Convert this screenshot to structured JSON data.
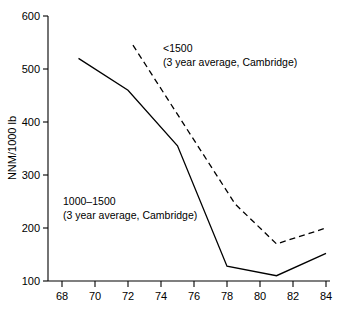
{
  "chart_data": {
    "type": "line",
    "title": "",
    "subtitle": "",
    "xlabel": "",
    "ylabel": "NNM/1000 lb",
    "xlim": [
      67.2,
      84.6
    ],
    "ylim": [
      100,
      600
    ],
    "xticks": [
      68,
      70,
      72,
      74,
      76,
      78,
      80,
      82,
      84
    ],
    "xtick_labels": [
      "68",
      "70",
      "72",
      "74",
      "76",
      "78",
      "80",
      "82",
      "84"
    ],
    "yticks": [
      100,
      200,
      300,
      400,
      500,
      600
    ],
    "ytick_labels": [
      "100",
      "200",
      "300",
      "400",
      "500",
      "600"
    ],
    "grid": false,
    "legend_position": "inline-annotations",
    "series": [
      {
        "name": "1000-1500 (3 year average, Cambridge)",
        "style": "solid",
        "color": "#000000",
        "x": [
          69.0,
          72.0,
          75.0,
          78.0,
          81.0,
          84.0
        ],
        "values": [
          520,
          460,
          355,
          128,
          110,
          152
        ]
      },
      {
        "name": "<1500 (3 year average, Cambridge)",
        "style": "dashed",
        "color": "#000000",
        "x": [
          72.3,
          78.5,
          81.0,
          84.0
        ],
        "values": [
          545,
          245,
          170,
          200
        ]
      }
    ],
    "annotations": [
      {
        "id": "annot-upper",
        "line1": "<1500",
        "line2": "(3 year average, Cambridge)",
        "x": 75.0,
        "y": 525
      },
      {
        "id": "annot-lower",
        "line1": "1000–1500",
        "line2": "(3 year average, Cambridge)",
        "x": 69.5,
        "y": 248
      }
    ]
  }
}
